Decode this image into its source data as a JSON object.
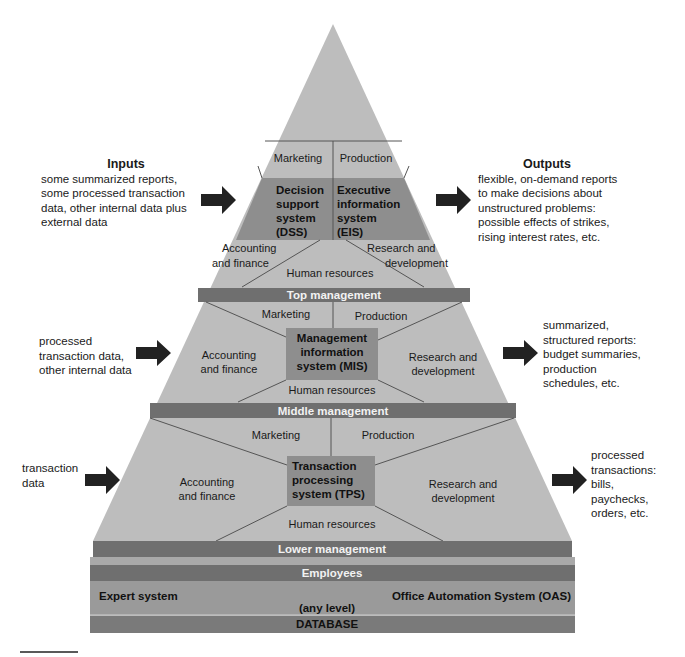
{
  "colors": {
    "pyramid_fill": "#bdbdbd",
    "system_box": "#8e8e8e",
    "band": "#6f6f6f",
    "band_text": "#f2f2f2",
    "line": "#555555",
    "arrow": "#222222"
  },
  "top_level": {
    "inputs_heading": "Inputs",
    "inputs_lines": [
      "some summarized reports,",
      "some processed transaction",
      "data, other internal data plus",
      "external data"
    ],
    "outputs_heading": "Outputs",
    "outputs_lines": [
      "flexible, on-demand reports",
      "to make decisions about",
      "unstructured problems:",
      "possible effects of strikes,",
      "rising interest rates, etc."
    ],
    "sections": {
      "marketing": "Marketing",
      "production": "Production",
      "accounting_1": "Accounting",
      "accounting_2": "and finance",
      "research_1": "Research and",
      "research_2": "development",
      "human_resources": "Human resources"
    },
    "dss_lines": [
      "Decision",
      "support",
      "system",
      "(DSS)"
    ],
    "eis_lines": [
      "Executive",
      "information",
      "system",
      "(EIS)"
    ],
    "band_label": "Top management"
  },
  "middle_level": {
    "inputs_lines": [
      "processed",
      "transaction data,",
      "other internal data"
    ],
    "outputs_lines": [
      "summarized,",
      "structured reports:",
      "budget summaries,",
      "production",
      "schedules, etc."
    ],
    "sections": {
      "marketing": "Marketing",
      "production": "Production",
      "accounting_1": "Accounting",
      "accounting_2": "and finance",
      "research_1": "Research and",
      "research_2": "development",
      "human_resources": "Human resources"
    },
    "mis_lines": [
      "Management",
      "information",
      "system (MIS)"
    ],
    "band_label": "Middle management"
  },
  "lower_level": {
    "inputs_lines": [
      "transaction",
      "data"
    ],
    "outputs_lines": [
      "processed",
      "transactions:",
      "bills,",
      "paychecks,",
      "orders, etc."
    ],
    "sections": {
      "marketing": "Marketing",
      "production": "Production",
      "accounting_1": "Accounting",
      "accounting_2": "and finance",
      "research_1": "Research and",
      "research_2": "development",
      "human_resources": "Human resources"
    },
    "tps_lines": [
      "Transaction",
      "processing",
      "system (TPS)"
    ],
    "band_label": "Lower management"
  },
  "base": {
    "employees": "Employees",
    "expert_system": "Expert system",
    "oas": "Office Automation System (OAS)",
    "any_level": "(any level)",
    "database": "DATABASE"
  }
}
